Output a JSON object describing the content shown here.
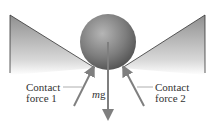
{
  "diagram": {
    "labels": {
      "contact1_line1": "Contact",
      "contact1_line2": "force 1",
      "contact2_line1": "Contact",
      "contact2_line2": "force 2",
      "weight_m": "m",
      "weight_g": "g"
    },
    "colors": {
      "ball": "#7a7a7a",
      "wedge": "#9a9a9a",
      "arrow": "#7f7f7f"
    }
  }
}
